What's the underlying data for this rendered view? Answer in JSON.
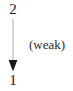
{
  "diagram": {
    "type": "directed-graph",
    "background_color": "#ffffff",
    "nodes": [
      {
        "id": "top",
        "label": "2",
        "x": 13,
        "y": 9
      },
      {
        "id": "bottom",
        "label": "1",
        "x": 13,
        "y": 81
      }
    ],
    "edges": [
      {
        "id": "edge-2-to-1",
        "from": "2",
        "to": "1",
        "direction": "down",
        "annotation": "(weak)",
        "shaft_color": "#b9b9b9",
        "head_color": "#1a1a1a",
        "shaft_width": 1,
        "head_width": 9,
        "head_height": 11,
        "start_y": 19,
        "end_y": 71
      }
    ]
  }
}
